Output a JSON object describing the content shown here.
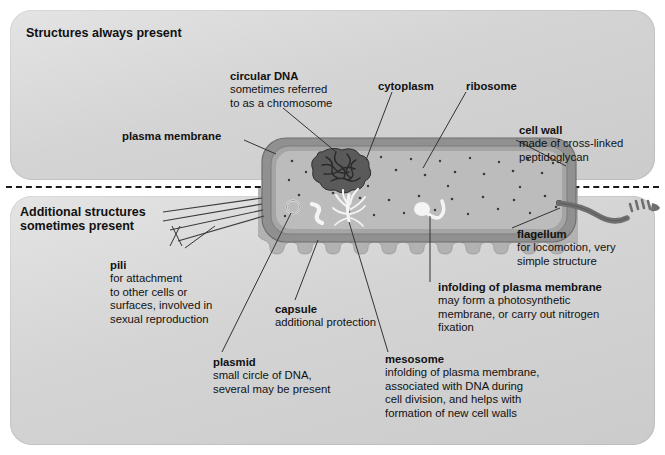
{
  "figure": {
    "panels": [
      {
        "id": "always",
        "title": "Structures always present"
      },
      {
        "id": "sometimes",
        "title": "Additional structures\nsometimes present"
      }
    ]
  },
  "colors": {
    "page_background": "#ffffff",
    "panel_fill": "#d3d3d3",
    "text": "#111111",
    "cell_wall": "#8e8e8e",
    "capsule": "#b0b0b0",
    "cytoplasm": "#b8b8b8",
    "cytoplasm_light": "#c2c2c2",
    "dna": "#4a4a4a",
    "leader_line": "#333333",
    "flagellum": "#6e6e6e",
    "mesosome": "#f2f2f2"
  },
  "labels": {
    "circular_dna": {
      "heading": "circular DNA",
      "body": "sometimes referred\nto as a chromosome"
    },
    "cytoplasm": {
      "heading": "cytoplasm",
      "body": ""
    },
    "ribosome": {
      "heading": "ribosome",
      "body": ""
    },
    "plasma_membrane": {
      "heading": "plasma membrane",
      "body": ""
    },
    "cell_wall": {
      "heading": "cell wall",
      "body": "made of cross-linked\npeptidoglycan"
    },
    "pili": {
      "heading": "pili",
      "body": "for attachment\nto other cells or\nsurfaces, involved in\nsexual reproduction"
    },
    "capsule": {
      "heading": "capsule",
      "body": "additional protection"
    },
    "plasmid": {
      "heading": "plasmid",
      "body": "small circle of DNA,\nseveral may be present"
    },
    "mesosome": {
      "heading": "mesosome",
      "body": "infolding of plasma membrane,\nassociated with DNA during\ncell division, and helps with\nformation of new cell walls"
    },
    "infolding": {
      "heading": "infolding of plasma membrane",
      "body": "may form a photosynthetic\nmembrane, or carry out nitrogen\nfixation"
    },
    "flagellum": {
      "heading": "flagellum",
      "body": "for locomotion, very\nsimple structure"
    }
  },
  "cell_parts": [
    "cell-wall",
    "capsule",
    "cytoplasm",
    "circular-dna",
    "ribosomes",
    "plasmid",
    "mesosome",
    "infolding-of-plasma-membrane",
    "pili",
    "flagellum"
  ]
}
